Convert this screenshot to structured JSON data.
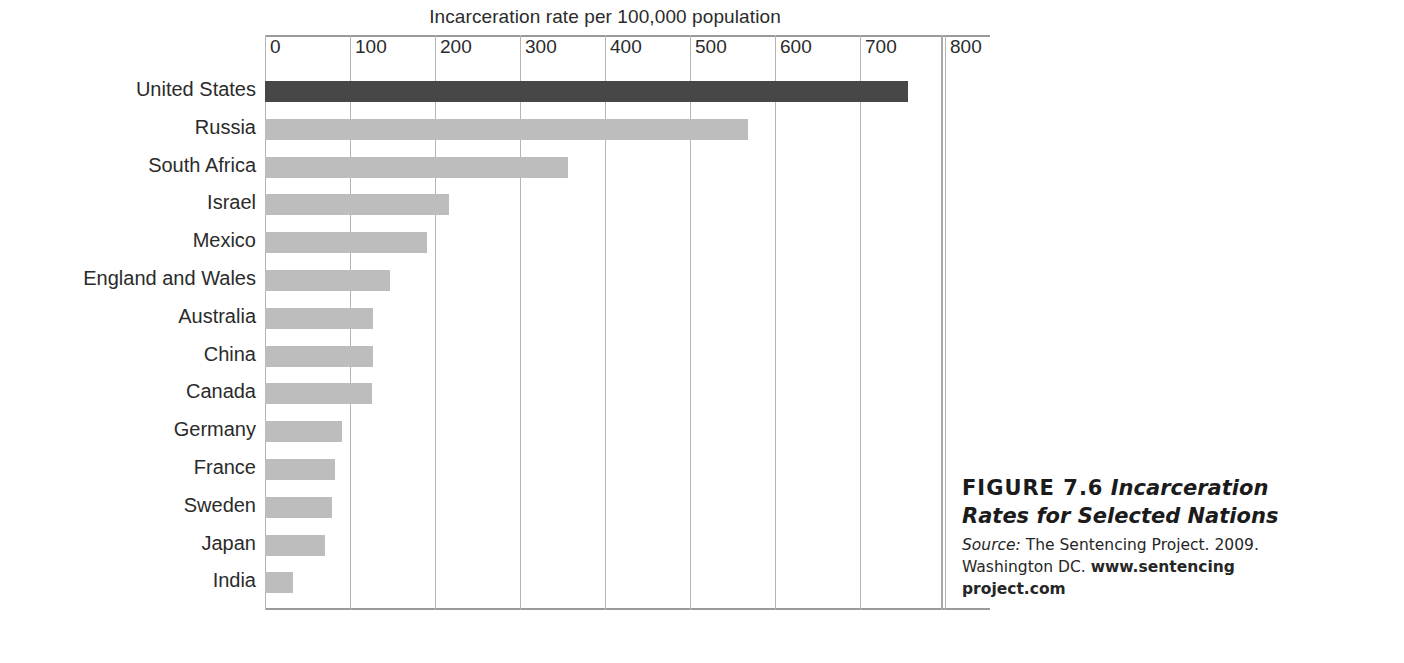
{
  "figure": {
    "number_label": "FIGURE 7.6",
    "title": "Incarceration Rates for Selected Nations",
    "title_line1": "Incarceration",
    "title_line2": "Rates for Selected Nations",
    "source_word": "Source:",
    "source_text": "The Sentencing Project. 2009.",
    "source_text2": "Washington DC.",
    "source_url_line1": "www.sentencing",
    "source_url_line2": "project.com"
  },
  "colors": {
    "highlight_bar": "#474747",
    "bar": "#bdbdbd",
    "gridline": "#b4b4b4",
    "axis_rule": "#9a9a9a",
    "text": "#2b2b2b",
    "background": "#ffffff"
  },
  "chart_data": {
    "type": "bar",
    "orientation": "horizontal",
    "title": "",
    "xlabel": "Incarceration rate per 100,000 population",
    "ylabel": "",
    "xlim": [
      0,
      800
    ],
    "xticks": [
      0,
      100,
      200,
      300,
      400,
      500,
      600,
      700,
      800
    ],
    "xtick_labels": [
      "0",
      "100",
      "200",
      "300",
      "400",
      "500",
      "600",
      "700",
      "800"
    ],
    "grid": true,
    "grid_axis": "x",
    "legend": false,
    "highlight_category": "United States",
    "categories": [
      "United States",
      "Russia",
      "South Africa",
      "Israel",
      "Mexico",
      "England and Wales",
      "Australia",
      "China",
      "Canada",
      "Germany",
      "France",
      "Sweden",
      "Japan",
      "India"
    ],
    "values": [
      756,
      568,
      356,
      216,
      190,
      147,
      127,
      127,
      126,
      91,
      82,
      79,
      71,
      33
    ],
    "units": "per 100,000 population"
  }
}
